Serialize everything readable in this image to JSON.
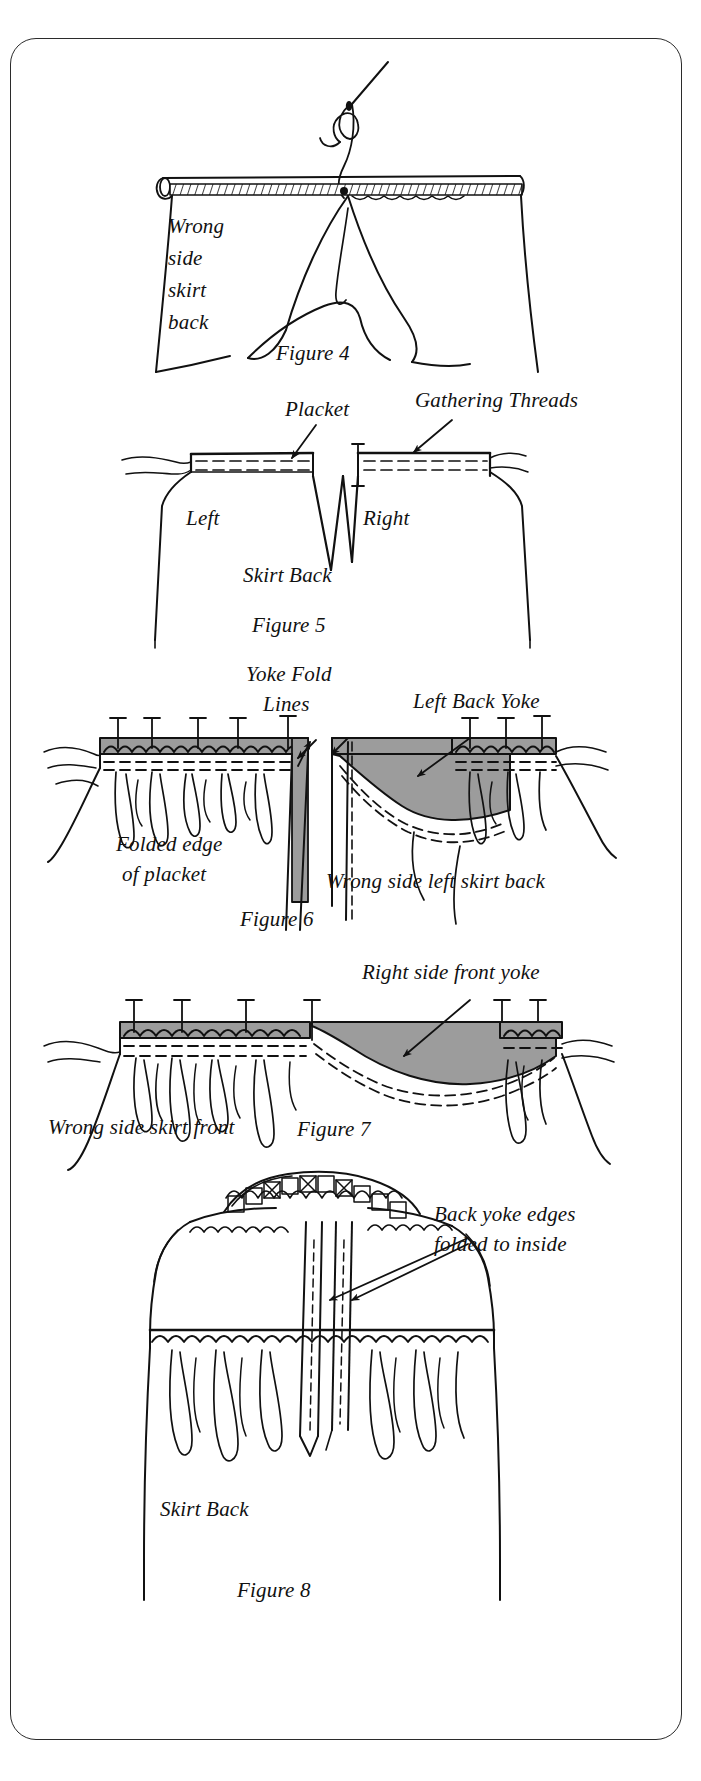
{
  "page": {
    "background_color": "#ffffff",
    "ink_color": "#111111",
    "frame_color": "#2b2b2b",
    "yoke_fill_color": "#9c9c9c"
  },
  "figures": [
    {
      "id": "figure-4",
      "caption": "Figure 4",
      "labels": [
        {
          "name": "wrong-side-skirt-back",
          "lines": [
            "Wrong",
            "side",
            "skirt",
            "back"
          ]
        }
      ]
    },
    {
      "id": "figure-5",
      "caption": "Figure 5",
      "labels": [
        {
          "name": "placket",
          "lines": [
            "Placket"
          ]
        },
        {
          "name": "gathering-threads",
          "lines": [
            "Gathering Threads"
          ]
        },
        {
          "name": "left",
          "lines": [
            "Left"
          ]
        },
        {
          "name": "right",
          "lines": [
            "Right"
          ]
        },
        {
          "name": "skirt-back",
          "lines": [
            "Skirt Back"
          ]
        }
      ]
    },
    {
      "id": "figure-6",
      "caption": "Figure 6",
      "labels": [
        {
          "name": "yoke-fold-lines",
          "lines": [
            "Yoke Fold",
            "Lines"
          ]
        },
        {
          "name": "left-back-yoke",
          "lines": [
            "Left Back Yoke"
          ]
        },
        {
          "name": "folded-edge-of-placket",
          "lines": [
            "Folded edge",
            "of placket"
          ]
        },
        {
          "name": "wrong-side-left-skirt-back",
          "lines": [
            "Wrong side left skirt back"
          ]
        }
      ]
    },
    {
      "id": "figure-7",
      "caption": "Figure 7",
      "labels": [
        {
          "name": "right-side-front-yoke",
          "lines": [
            "Right side front yoke"
          ]
        },
        {
          "name": "wrong-side-skirt-front",
          "lines": [
            "Wrong side skirt front"
          ]
        }
      ]
    },
    {
      "id": "figure-8",
      "caption": "Figure 8",
      "labels": [
        {
          "name": "back-yoke-edges-folded-to-inside",
          "lines": [
            "Back yoke edges",
            "folded to inside"
          ]
        },
        {
          "name": "skirt-back",
          "lines": [
            "Skirt Back"
          ]
        }
      ]
    }
  ],
  "text": {
    "fig4_wrong": "Wrong",
    "fig4_side": "side",
    "fig4_skirt": "skirt",
    "fig4_back": "back",
    "fig4_caption": "Figure 4",
    "fig5_placket": "Placket",
    "fig5_gathering_threads": "Gathering Threads",
    "fig5_left": "Left",
    "fig5_right": "Right",
    "fig5_skirt_back": "Skirt Back",
    "fig5_caption": "Figure 5",
    "fig6_yoke_fold": "Yoke Fold",
    "fig6_lines": "Lines",
    "fig6_left_back_yoke": "Left Back Yoke",
    "fig6_folded_edge": "Folded edge",
    "fig6_of_placket": "of placket",
    "fig6_wrong_side_left_skirt_back": "Wrong side left skirt back",
    "fig6_caption": "Figure 6",
    "fig7_right_side_front_yoke": "Right side front yoke",
    "fig7_wrong_side_skirt_front": "Wrong side skirt front",
    "fig7_caption": "Figure 7",
    "fig8_back_yoke_edges": "Back yoke edges",
    "fig8_folded_to_inside": "folded to inside",
    "fig8_skirt_back": "Skirt Back",
    "fig8_caption": "Figure 8"
  }
}
